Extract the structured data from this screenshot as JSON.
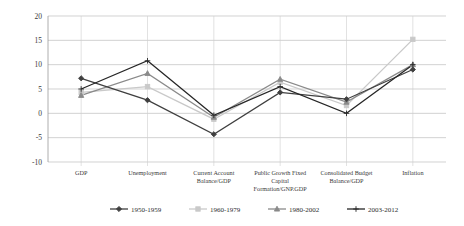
{
  "chart_data": {
    "type": "line",
    "title": "",
    "subtitle": "",
    "xlabel": "",
    "ylabel": "",
    "ylim": [
      -10,
      20
    ],
    "yticks": [
      -10,
      -5,
      0,
      5,
      10,
      15,
      20
    ],
    "ytick_labels": [
      "-10",
      "-5",
      "0",
      "5",
      "10",
      "15",
      "20"
    ],
    "grid": true,
    "legend_position": "bottom",
    "categories": [
      "GDP",
      "Unemployment",
      "Current Account\nBalance/GDP",
      "Public Growth Fixed\nCapital\nFormation/GNP.GDP",
      "Consolidated Budget\nBalance/GDP",
      "Inflation"
    ],
    "category_lines": [
      [
        "GDP"
      ],
      [
        "Unemployment"
      ],
      [
        "Current Account",
        "Balance/GDP"
      ],
      [
        "Public Growth Fixed",
        "Capital",
        "Formation/GNP.GDP"
      ],
      [
        "Consolidated Budget",
        "Balance/GDP"
      ],
      [
        "Inflation"
      ]
    ],
    "series": [
      {
        "name": "1950-1959",
        "color": "#3f3f3f",
        "marker": "diamond",
        "values": [
          7.2,
          2.7,
          -4.3,
          4.3,
          2.9,
          9.0
        ]
      },
      {
        "name": "1960-1979",
        "color": "#c9c9c9",
        "marker": "square",
        "values": [
          4.3,
          5.5,
          -1.2,
          6.4,
          1.6,
          15.2
        ]
      },
      {
        "name": "1980-2002",
        "color": "#8a8a8a",
        "marker": "triangle",
        "values": [
          3.7,
          8.2,
          -0.8,
          7.0,
          2.3,
          10.0
        ]
      },
      {
        "name": "2003-2012",
        "color": "#262626",
        "marker": "cross",
        "values": [
          5.0,
          10.8,
          -0.4,
          5.5,
          0.0,
          10.0
        ]
      }
    ]
  },
  "legend": {
    "entries": [
      "1950-1959",
      "1960-1979",
      "1980-2002",
      "2003-2012"
    ]
  }
}
